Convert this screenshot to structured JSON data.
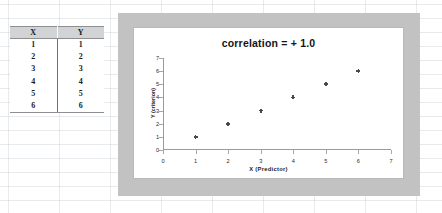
{
  "table": {
    "headers": [
      "X",
      "Y"
    ],
    "rows": [
      [
        "1",
        "1"
      ],
      [
        "2",
        "2"
      ],
      [
        "3",
        "3"
      ],
      [
        "4",
        "4"
      ],
      [
        "5",
        "5"
      ],
      [
        "6",
        "6"
      ]
    ]
  },
  "chart_data": {
    "type": "scatter",
    "title": "correlation  =  + 1.0",
    "xlabel": "X  (Predictor)",
    "ylabel": "Y (criterion)",
    "xlim": [
      0,
      7
    ],
    "ylim": [
      0,
      7
    ],
    "xticks": [
      "0",
      "1",
      "2",
      "3",
      "4",
      "5",
      "6",
      "7"
    ],
    "yticks": [
      "0",
      "1",
      "2",
      "3",
      "4",
      "5",
      "6",
      "7"
    ],
    "grid": false,
    "legend": "none",
    "marker": "plus",
    "marker_color": "#4a4a4a",
    "series": [
      {
        "name": "Y (criterion)",
        "points": [
          {
            "x": 1,
            "y": 1
          },
          {
            "x": 2,
            "y": 2
          },
          {
            "x": 3,
            "y": 3
          },
          {
            "x": 4,
            "y": 4
          },
          {
            "x": 5,
            "y": 5
          },
          {
            "x": 6,
            "y": 6
          }
        ]
      }
    ]
  },
  "colors": {
    "chart_frame": "#c2c2c2",
    "plot_background": "#ffffff",
    "axis": "#9b9b9b",
    "header_fill": "#d2d3d5"
  }
}
